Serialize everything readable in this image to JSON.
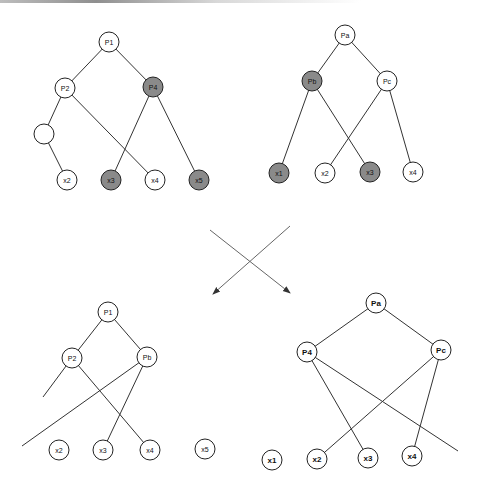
{
  "colors": {
    "node_fill": "#ffffff",
    "node_highlight_fill": "#8a8a8a",
    "stroke": "#333333",
    "arrow": "#666666"
  },
  "diagrams": [
    {
      "id": "top-left",
      "nodes": [
        {
          "id": "P1",
          "label": "P1",
          "x": 109,
          "y": 42,
          "r": 10,
          "filled": false
        },
        {
          "id": "P2",
          "label": "P2",
          "x": 65,
          "y": 88,
          "r": 10,
          "filled": false
        },
        {
          "id": "P4",
          "label": "P4",
          "x": 153,
          "y": 87,
          "r": 10,
          "filled": true
        },
        {
          "id": "E",
          "label": "",
          "x": 44,
          "y": 134,
          "r": 10,
          "filled": false
        },
        {
          "id": "x2",
          "label": "x2",
          "x": 67,
          "y": 180,
          "r": 10,
          "filled": false
        },
        {
          "id": "x3",
          "label": "x3",
          "x": 111,
          "y": 180,
          "r": 10,
          "filled": true
        },
        {
          "id": "x4",
          "label": "x4",
          "x": 155,
          "y": 180,
          "r": 10,
          "filled": false
        },
        {
          "id": "x5",
          "label": "x5",
          "x": 199,
          "y": 180,
          "r": 10,
          "filled": true
        }
      ],
      "edges": [
        [
          "P1",
          "P2"
        ],
        [
          "P1",
          "P4"
        ],
        [
          "P2",
          "E"
        ],
        [
          "E",
          "x2"
        ],
        [
          "P2",
          "x4"
        ],
        [
          "P4",
          "x3"
        ],
        [
          "P4",
          "x5"
        ]
      ]
    },
    {
      "id": "top-right",
      "nodes": [
        {
          "id": "Pa",
          "label": "Pa",
          "x": 345,
          "y": 35,
          "r": 10,
          "filled": false
        },
        {
          "id": "Pb",
          "label": "Pb",
          "x": 312,
          "y": 81,
          "r": 10,
          "filled": true
        },
        {
          "id": "Pc",
          "label": "Pc",
          "x": 387,
          "y": 81,
          "r": 10,
          "filled": false
        },
        {
          "id": "x1",
          "label": "x1",
          "x": 279,
          "y": 173,
          "r": 10,
          "filled": true
        },
        {
          "id": "x2",
          "label": "x2",
          "x": 325,
          "y": 173,
          "r": 10,
          "filled": false
        },
        {
          "id": "x3",
          "label": "x3",
          "x": 370,
          "y": 172,
          "r": 10,
          "filled": true
        },
        {
          "id": "x4",
          "label": "x4",
          "x": 413,
          "y": 172,
          "r": 10,
          "filled": false
        }
      ],
      "edges": [
        [
          "Pa",
          "Pb"
        ],
        [
          "Pa",
          "Pc"
        ],
        [
          "Pb",
          "x1"
        ],
        [
          "Pb",
          "x3"
        ],
        [
          "Pc",
          "x2"
        ],
        [
          "Pc",
          "x4"
        ]
      ]
    },
    {
      "id": "bottom-left",
      "nodes": [
        {
          "id": "P1",
          "label": "P1",
          "x": 108,
          "y": 312,
          "r": 10,
          "filled": false
        },
        {
          "id": "P2",
          "label": "P2",
          "x": 72,
          "y": 358,
          "r": 10,
          "filled": false
        },
        {
          "id": "Pb",
          "label": "Pb",
          "x": 147,
          "y": 357,
          "r": 10,
          "filled": false
        },
        {
          "id": "x2",
          "label": "x2",
          "x": 59,
          "y": 450,
          "r": 10,
          "filled": false
        },
        {
          "id": "x3",
          "label": "x3",
          "x": 103,
          "y": 450,
          "r": 10,
          "filled": false
        },
        {
          "id": "x4",
          "label": "x4",
          "x": 150,
          "y": 450,
          "r": 10,
          "filled": false
        },
        {
          "id": "x5",
          "label": "x5",
          "x": 205,
          "y": 449,
          "r": 10,
          "filled": false
        }
      ],
      "edges": [
        [
          "P1",
          "P2"
        ],
        [
          "P1",
          "Pb"
        ],
        [
          "P2",
          "x4"
        ],
        [
          "Pb",
          "x3"
        ]
      ],
      "dangling": [
        {
          "from": "P2",
          "x2": 43,
          "y2": 397
        },
        {
          "from": "Pb",
          "x2": 22,
          "y2": 446
        }
      ]
    },
    {
      "id": "bottom-right",
      "nodes": [
        {
          "id": "Pa",
          "label": "Pa",
          "x": 376,
          "y": 303,
          "r": 10,
          "filled": false,
          "bold": true
        },
        {
          "id": "P4",
          "label": "P4",
          "x": 307,
          "y": 352,
          "r": 10,
          "filled": false,
          "bold": true
        },
        {
          "id": "Pc",
          "label": "Pc",
          "x": 441,
          "y": 350,
          "r": 10,
          "filled": false,
          "bold": true
        },
        {
          "id": "x1",
          "label": "x1",
          "x": 272,
          "y": 460,
          "r": 10,
          "filled": false,
          "bold": true
        },
        {
          "id": "x2",
          "label": "x2",
          "x": 317,
          "y": 459,
          "r": 10,
          "filled": false,
          "bold": true
        },
        {
          "id": "x3",
          "label": "x3",
          "x": 368,
          "y": 458,
          "r": 10,
          "filled": false,
          "bold": true
        },
        {
          "id": "x4",
          "label": "x4",
          "x": 412,
          "y": 456,
          "r": 10,
          "filled": false,
          "bold": true
        }
      ],
      "edges": [
        [
          "Pa",
          "P4"
        ],
        [
          "Pa",
          "Pc"
        ],
        [
          "P4",
          "x3"
        ],
        [
          "Pc",
          "x2"
        ],
        [
          "Pc",
          "x4"
        ]
      ],
      "dangling": [
        {
          "from": "P4",
          "x2": 458,
          "y2": 451
        }
      ]
    }
  ],
  "arrows": [
    {
      "x1": 210,
      "y1": 230,
      "x2": 290,
      "y2": 293
    },
    {
      "x1": 290,
      "y1": 226,
      "x2": 213,
      "y2": 294
    }
  ]
}
